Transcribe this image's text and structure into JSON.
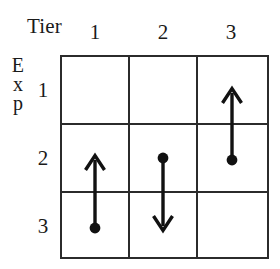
{
  "figure": {
    "type": "grid-diagram",
    "title_x": "Tier",
    "title_y": "Exp",
    "title_y_letters": [
      "E",
      "x",
      "p"
    ],
    "column_headers": [
      "1",
      "2",
      "3"
    ],
    "row_headers": [
      "1",
      "2",
      "3"
    ],
    "grid": {
      "rows": 3,
      "cols": 3,
      "line_color": "#2b2b2b",
      "background": "#ffffff"
    },
    "markers": {
      "dot_color": "#111111",
      "arrow_color": "#111111"
    },
    "arrows": [
      {
        "name": "arrow-col1",
        "column": "1",
        "start_row": "3",
        "end_row": "2",
        "direction": "up",
        "dot_at": "start",
        "dot_row": "3",
        "tip_row": "2"
      },
      {
        "name": "arrow-col2",
        "column": "2",
        "start_row": "2",
        "end_row": "3",
        "direction": "down",
        "dot_at": "start",
        "dot_row": "2",
        "tip_row": "3"
      },
      {
        "name": "arrow-col3",
        "column": "3",
        "start_row": "2",
        "end_row": "1",
        "direction": "up",
        "dot_at": "start",
        "dot_row": "2",
        "tip_row": "1"
      }
    ]
  }
}
